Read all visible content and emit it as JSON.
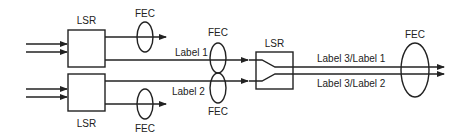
{
  "diagram": {
    "nodes": {
      "lsr_top": {
        "label": "LSR"
      },
      "lsr_bottom": {
        "label": "LSR"
      },
      "lsr_middle": {
        "label": "LSR"
      }
    },
    "fec": {
      "top_out": "FEC",
      "bottom_out": "FEC",
      "label1": "FEC",
      "label2": "FEC",
      "right": "FEC"
    },
    "edges": {
      "label1": "Label 1",
      "label2": "Label 2",
      "label3_1": "Label 3/Label 1",
      "label3_2": "Label 3/Label 2"
    },
    "colors": {
      "stroke": "#222222",
      "background": "#ffffff"
    }
  }
}
